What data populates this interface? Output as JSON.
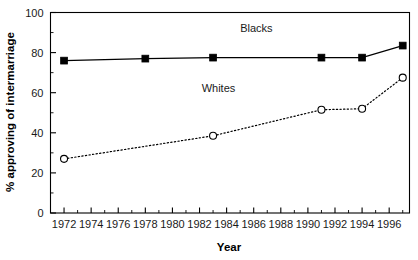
{
  "chart_data": {
    "type": "line",
    "title": "",
    "xlabel": "Year",
    "ylabel": "% approving of intermarriage",
    "xlim": [
      1971,
      1997.5
    ],
    "ylim": [
      0,
      100
    ],
    "grid": false,
    "legend_position": "inline-annotation",
    "x_ticks": [
      1972,
      1974,
      1976,
      1978,
      1980,
      1982,
      1984,
      1986,
      1988,
      1990,
      1992,
      1994,
      1996
    ],
    "x_tick_labels": [
      "1972",
      "1974",
      "1976",
      "1978",
      "1980",
      "1982",
      "1984",
      "1986",
      "1988",
      "1990",
      "1992",
      "1994",
      "1996"
    ],
    "x_minor_ticks": [
      1973,
      1975,
      1977,
      1979,
      1981,
      1983,
      1985,
      1987,
      1989,
      1991,
      1993,
      1995,
      1997
    ],
    "y_ticks": [
      0,
      20,
      40,
      60,
      80,
      100
    ],
    "y_tick_labels": [
      "0",
      "20",
      "40",
      "60",
      "80",
      "100"
    ],
    "y_minor_ticks": [
      10,
      30,
      50,
      70,
      90
    ],
    "series": [
      {
        "name": "Blacks",
        "marker": "filled-square",
        "line_style": "solid",
        "color": "#000000",
        "annotation_label": "Blacks",
        "annotation_x": 1986.2,
        "annotation_y": 90.5,
        "x": [
          1972,
          1978,
          1983,
          1991,
          1994,
          1997
        ],
        "values": [
          76,
          77,
          77.5,
          77.5,
          77.5,
          83.5
        ]
      },
      {
        "name": "Whites",
        "marker": "open-circle",
        "line_style": "dotted",
        "color": "#000000",
        "annotation_label": "Whites",
        "annotation_x": 1983.4,
        "annotation_y": 60.5,
        "x": [
          1972,
          1983,
          1991,
          1994,
          1997
        ],
        "values": [
          27,
          38.5,
          51.5,
          52,
          67.5
        ]
      }
    ]
  }
}
